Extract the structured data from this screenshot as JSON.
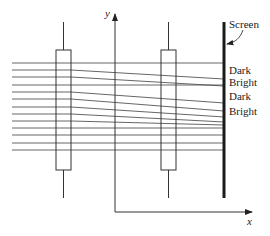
{
  "diagram": {
    "axes": {
      "y_label": "y",
      "x_label": "x"
    },
    "screen_label": "Screen",
    "fringe_labels": [
      "Dark",
      "Bright",
      "Dark",
      "Bright"
    ],
    "colors": {
      "line": "#444444",
      "screen": "#1a1a1a",
      "background": "#ffffff"
    },
    "rays": {
      "count": 13,
      "left_y": [
        63,
        70,
        77,
        85,
        92,
        99,
        107,
        114,
        121,
        128,
        135,
        143,
        150
      ],
      "screen_y": [
        63,
        79,
        86,
        85,
        103,
        111,
        117,
        122,
        125,
        128,
        135,
        143,
        150
      ]
    },
    "slits": [
      {
        "name": "first-barrier",
        "x": 56,
        "width": 15
      },
      {
        "name": "second-barrier",
        "x": 161,
        "width": 15
      }
    ]
  }
}
